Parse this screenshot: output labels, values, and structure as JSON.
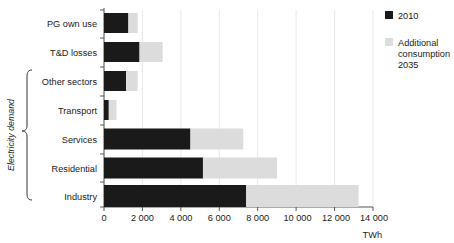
{
  "chart_data": {
    "type": "bar",
    "orientation": "horizontal",
    "stacked": true,
    "title": "",
    "xlabel": "TWh",
    "ylabel": "",
    "xlim": [
      0,
      14000
    ],
    "xticks": [
      0,
      2000,
      4000,
      6000,
      8000,
      10000,
      12000,
      14000
    ],
    "xtick_labels": [
      "0",
      "2 000",
      "4 000",
      "6 000",
      "8 000",
      "10 000",
      "12 000",
      "14 000"
    ],
    "grid": true,
    "grid_axis": "x",
    "legend_position": "right",
    "categories": [
      "PG own use",
      "T&D losses",
      "Other sectors",
      "Transport",
      "Services",
      "Residential",
      "Industry"
    ],
    "series": [
      {
        "name": "2010",
        "color": "#1a1a1a",
        "values": [
          1270,
          1850,
          1150,
          250,
          4500,
          5150,
          7400
        ]
      },
      {
        "name": "Additional consumption 2035",
        "color": "#dcdcdc",
        "values": [
          480,
          1200,
          600,
          400,
          2750,
          3850,
          5850
        ]
      }
    ],
    "totals": [
      1750,
      3050,
      1750,
      650,
      7250,
      9000,
      13250
    ],
    "annotations": [
      {
        "text": "Electricity demand",
        "type": "group-brace",
        "covers": [
          "Other sectors",
          "Transport",
          "Services",
          "Residential",
          "Industry"
        ]
      }
    ]
  },
  "legend": {
    "items": [
      {
        "label": "2010",
        "swatch_color": "#1a1a1a",
        "swatch_name": "legend-swatch-2010"
      },
      {
        "label_line1": "Additional",
        "label_line2": "consumption",
        "label_line3": "2035",
        "swatch_color": "#dcdcdc",
        "swatch_name": "legend-swatch-additional"
      }
    ]
  },
  "axis": {
    "unit": "TWh"
  }
}
